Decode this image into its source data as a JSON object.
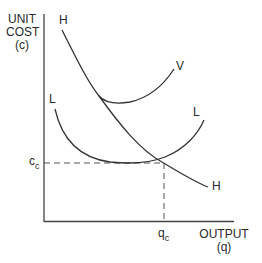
{
  "diagram": {
    "y_axis_label": [
      "UNIT",
      "COST",
      "(c)"
    ],
    "x_axis_label": [
      "OUTPUT",
      "(q)"
    ],
    "curves": [
      {
        "id": "H",
        "label_start": "H",
        "label_end": "H"
      },
      {
        "id": "V",
        "label": "V"
      },
      {
        "id": "L",
        "label_start": "L",
        "label_end": "L"
      }
    ],
    "marks": {
      "cost_label": "c",
      "cost_sub": "c",
      "output_label": "q",
      "output_sub": "c"
    },
    "colors": {
      "line": "#333333",
      "background": "#ffffff"
    }
  }
}
